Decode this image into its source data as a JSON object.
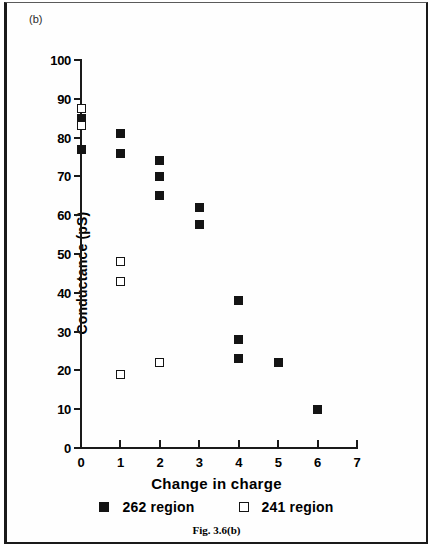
{
  "figure": {
    "panel_label": "(b)",
    "caption": "Fig. 3.6(b)"
  },
  "chart_data": {
    "type": "scatter",
    "title": "",
    "xlabel": "Change in charge",
    "ylabel": "Conductance  (pS)",
    "xlim": [
      0,
      7
    ],
    "ylim": [
      0,
      100
    ],
    "xticks": [
      0,
      1,
      2,
      3,
      4,
      5,
      6,
      7
    ],
    "yticks": [
      0,
      10,
      20,
      30,
      40,
      50,
      60,
      70,
      80,
      90,
      100
    ],
    "xtick_labels": [
      "0",
      "1",
      "2",
      "3",
      "4",
      "5",
      "6",
      "7"
    ],
    "ytick_labels": [
      "0",
      "10",
      "20",
      "30",
      "40",
      "50",
      "60",
      "70",
      "80",
      "90",
      "100"
    ],
    "grid": false,
    "legend_position": "below-axes",
    "series": [
      {
        "name": "262 region",
        "marker": "filled-square",
        "color": "#141414",
        "points": [
          {
            "x": 0,
            "y": 85
          },
          {
            "x": 0,
            "y": 77
          },
          {
            "x": 1,
            "y": 81
          },
          {
            "x": 1,
            "y": 76
          },
          {
            "x": 2,
            "y": 74
          },
          {
            "x": 2,
            "y": 70
          },
          {
            "x": 2,
            "y": 65
          },
          {
            "x": 3,
            "y": 62
          },
          {
            "x": 3,
            "y": 57.5
          },
          {
            "x": 4,
            "y": 38
          },
          {
            "x": 4,
            "y": 28
          },
          {
            "x": 4,
            "y": 23
          },
          {
            "x": 5,
            "y": 22
          },
          {
            "x": 6,
            "y": 10
          }
        ]
      },
      {
        "name": "241 region",
        "marker": "open-square",
        "color": "#141414",
        "points": [
          {
            "x": 0,
            "y": 87.5
          },
          {
            "x": 0,
            "y": 83
          },
          {
            "x": 1,
            "y": 48
          },
          {
            "x": 1,
            "y": 43
          },
          {
            "x": 1,
            "y": 19
          },
          {
            "x": 2,
            "y": 22
          }
        ]
      }
    ]
  }
}
